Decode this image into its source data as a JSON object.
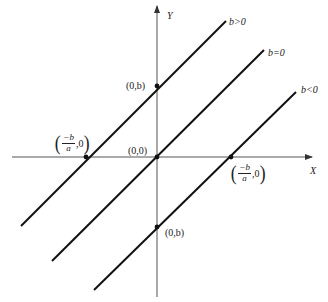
{
  "figure": {
    "axes": {
      "x_label": "X",
      "y_label": "Y",
      "origin_label": "(0,0)"
    },
    "lines": [
      {
        "id": "b_positive",
        "label": "b>0",
        "y_intercept_label": "(0,b)",
        "x_intercept_label": {
          "num": "−b",
          "den": "a",
          "tail": ",0"
        }
      },
      {
        "id": "b_zero",
        "label": "b=0"
      },
      {
        "id": "b_negative",
        "label": "b<0",
        "y_intercept_label": "(0,b)",
        "x_intercept_label": {
          "num": "−b",
          "den": "a",
          "tail": ",0"
        }
      }
    ],
    "colors": {
      "line": "#111111",
      "axis": "#555555",
      "text": "#222222"
    }
  }
}
